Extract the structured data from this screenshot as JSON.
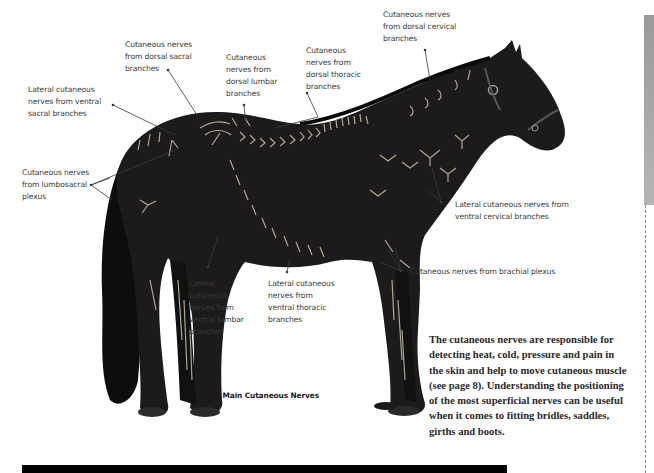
{
  "figure": {
    "caption": "The Main Cutaneous Nerves",
    "colors": {
      "horse_body": "#1c1a1b",
      "nerve_lines": "#c9c2a8",
      "leader_lines": "#3a3a3a",
      "label_text": "#3a3a3a"
    },
    "labels": [
      {
        "id": "dorsal-sacral",
        "text": "Cutaneous nerves\nfrom dorsal sacral\nbranches"
      },
      {
        "id": "dorsal-lumbar",
        "text": "Cutaneous\nnerves from\ndorsal lumbar\nbranches"
      },
      {
        "id": "dorsal-thoracic",
        "text": "Cutaneous\nnerves from\ndorsal thoracic\nbranches"
      },
      {
        "id": "dorsal-cervical",
        "text": "Cutaneous nerves\nfrom dorsal cervical\nbranches"
      },
      {
        "id": "ventral-sacral",
        "text": "Lateral cutaneous\nnerves from ventral\nsacral branches"
      },
      {
        "id": "lumbosacral",
        "text": "Cutaneous nerves\nfrom lumbosacral\nplexus"
      },
      {
        "id": "ventral-cervical",
        "text": "Lateral cutaneous nerves from\nventral cervical branches"
      },
      {
        "id": "brachial",
        "text": "Cutaneous nerves from brachial plexus"
      },
      {
        "id": "ventral-lumbar",
        "text": "Lateral\ncutaneous\nnerves from\nventral lumbar\nbranches"
      },
      {
        "id": "ventral-thoracic",
        "text": "Lateral cutaneous\nnerves from\nventral thoracic\nbranches"
      }
    ]
  },
  "body": {
    "paragraph": "The cutaneous nerves are responsible for detecting heat, cold, pressure and pain in the skin and help to move cutaneous muscle (see page 8). Understanding the positioning of the most superficial nerves can be useful when it comes to fitting bridles, saddles, girths and boots."
  },
  "page_decor": {
    "bottom_rule_color": "#000000",
    "side_tab_color": "#a8a8a8"
  }
}
